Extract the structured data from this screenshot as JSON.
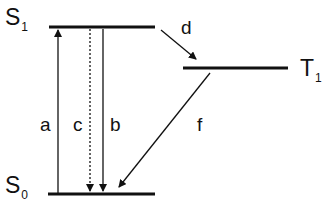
{
  "diagram": {
    "type": "Jablonski energy level diagram",
    "states": [
      {
        "id": "S1",
        "label": "S",
        "subscript": "1"
      },
      {
        "id": "T1",
        "label": "T",
        "subscript": "1"
      },
      {
        "id": "S0",
        "label": "S",
        "subscript": "0"
      }
    ],
    "transitions": [
      {
        "id": "a",
        "label": "a",
        "from": "S0",
        "to": "S1",
        "style": "solid",
        "direction": "up"
      },
      {
        "id": "c",
        "label": "c",
        "from": "S1",
        "to": "S0",
        "style": "dotted",
        "direction": "down"
      },
      {
        "id": "b",
        "label": "b",
        "from": "S1",
        "to": "S0",
        "style": "solid",
        "direction": "down"
      },
      {
        "id": "d",
        "label": "d",
        "from": "S1",
        "to": "T1",
        "style": "solid",
        "direction": "diagonal"
      },
      {
        "id": "f",
        "label": "f",
        "from": "T1",
        "to": "S0",
        "style": "solid",
        "direction": "diagonal"
      }
    ],
    "line_color": "#111111"
  }
}
